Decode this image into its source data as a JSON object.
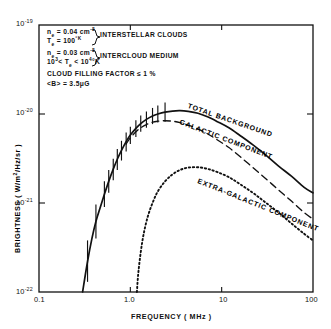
{
  "chart_data": {
    "type": "line",
    "title": "",
    "xlabel": "FREQUENCY ( MHz )",
    "ylabel": "BRIGHTNESS ( W/m2/Hz/sr )",
    "xscale": "log",
    "yscale": "log",
    "xlim": [
      0.1,
      100
    ],
    "ylim": [
      1e-22,
      1e-19
    ],
    "xticks": [
      "0.1",
      "1.0",
      "10",
      "100"
    ],
    "xtick_values": [
      0.1,
      1.0,
      10,
      100
    ],
    "yticks": [
      "10-19",
      "10-20",
      "10-21",
      "10-22"
    ],
    "ytick_values": [
      1e-19,
      1e-20,
      1e-21,
      1e-22
    ],
    "grid": false,
    "legend": "inline-curve-labels",
    "series": [
      {
        "name": "TOTAL BACKGROUND",
        "style": "solid",
        "points": [
          [
            0.3,
            1e-22
          ],
          [
            0.34,
            2.2e-22
          ],
          [
            0.38,
            4e-22
          ],
          [
            0.42,
            6.2e-22
          ],
          [
            0.47,
            9e-22
          ],
          [
            0.52,
            1.25e-21
          ],
          [
            0.58,
            1.75e-21
          ],
          [
            0.65,
            2.4e-21
          ],
          [
            0.72,
            3.1e-21
          ],
          [
            0.8,
            3.9e-21
          ],
          [
            0.9,
            4.9e-21
          ],
          [
            1.0,
            5.8e-21
          ],
          [
            1.15,
            6.9e-21
          ],
          [
            1.3,
            7.8e-21
          ],
          [
            1.5,
            8.7e-21
          ],
          [
            1.75,
            9.5e-21
          ],
          [
            2.0,
            1e-20
          ],
          [
            2.4,
            1.05e-20
          ],
          [
            2.9,
            1.08e-20
          ],
          [
            3.5,
            1.09e-20
          ],
          [
            4.3,
            1.07e-20
          ],
          [
            5.5,
            1.02e-20
          ],
          [
            7.0,
            9.3e-21
          ],
          [
            9.0,
            8.2e-21
          ],
          [
            12.0,
            7e-21
          ],
          [
            16.0,
            5.7e-21
          ],
          [
            22.0,
            4.5e-21
          ],
          [
            30.0,
            3.5e-21
          ],
          [
            42.0,
            2.6e-21
          ],
          [
            58.0,
            2e-21
          ],
          [
            80.0,
            1.5e-21
          ],
          [
            100.0,
            1.3e-21
          ]
        ]
      },
      {
        "name": "GALACTIC COMPONENT",
        "style": "dashed",
        "points": [
          [
            0.9,
            4.6e-21
          ],
          [
            1.0,
            5.4e-21
          ],
          [
            1.15,
            6.3e-21
          ],
          [
            1.3,
            7e-21
          ],
          [
            1.5,
            7.6e-21
          ],
          [
            1.75,
            8.1e-21
          ],
          [
            2.0,
            8.3e-21
          ],
          [
            2.4,
            8.4e-21
          ],
          [
            2.9,
            8.3e-21
          ],
          [
            3.5,
            8e-21
          ],
          [
            4.3,
            7.5e-21
          ],
          [
            5.5,
            6.8e-21
          ],
          [
            7.0,
            6e-21
          ],
          [
            9.0,
            5.1e-21
          ],
          [
            12.0,
            4.2e-21
          ],
          [
            16.0,
            3.3e-21
          ],
          [
            22.0,
            2.5e-21
          ],
          [
            30.0,
            1.9e-21
          ],
          [
            42.0,
            1.4e-21
          ],
          [
            58.0,
            1.05e-21
          ],
          [
            80.0,
            7.8e-22
          ],
          [
            100.0,
            6.6e-22
          ]
        ]
      },
      {
        "name": "EXTRA-GALACTIC COMPONENT",
        "style": "dotted",
        "points": [
          [
            1.18,
            1e-22
          ],
          [
            1.22,
            1.6e-22
          ],
          [
            1.3,
            2.8e-22
          ],
          [
            1.4,
            4.5e-22
          ],
          [
            1.55,
            7e-22
          ],
          [
            1.75,
            1e-21
          ],
          [
            2.0,
            1.35e-21
          ],
          [
            2.4,
            1.75e-21
          ],
          [
            2.9,
            2.1e-21
          ],
          [
            3.5,
            2.35e-21
          ],
          [
            4.3,
            2.5e-21
          ],
          [
            5.5,
            2.52e-21
          ],
          [
            7.0,
            2.42e-21
          ],
          [
            9.0,
            2.22e-21
          ],
          [
            12.0,
            1.95e-21
          ],
          [
            16.0,
            1.62e-21
          ],
          [
            22.0,
            1.3e-21
          ],
          [
            30.0,
            1.02e-21
          ],
          [
            42.0,
            7.8e-22
          ],
          [
            58.0,
            5.9e-22
          ],
          [
            80.0,
            4.5e-22
          ],
          [
            100.0,
            3.8e-22
          ]
        ]
      }
    ],
    "error_bars": [
      {
        "x": 0.34,
        "y": 2.2e-22,
        "lo": 1.3e-22,
        "hi": 3.8e-22
      },
      {
        "x": 0.42,
        "y": 6.2e-22,
        "lo": 4e-22,
        "hi": 9.6e-22
      },
      {
        "x": 0.52,
        "y": 1.25e-21,
        "lo": 9e-22,
        "hi": 1.75e-21
      },
      {
        "x": 0.58,
        "y": 1.75e-21,
        "lo": 1.3e-21,
        "hi": 2.35e-21
      },
      {
        "x": 0.65,
        "y": 2.4e-21,
        "lo": 1.8e-21,
        "hi": 3.15e-21
      },
      {
        "x": 0.72,
        "y": 3.1e-21,
        "lo": 2.35e-21,
        "hi": 4.05e-21
      },
      {
        "x": 0.8,
        "y": 3.9e-21,
        "lo": 3e-21,
        "hi": 5e-21
      },
      {
        "x": 0.9,
        "y": 4.9e-21,
        "lo": 3.8e-21,
        "hi": 6.2e-21
      },
      {
        "x": 1.0,
        "y": 5.8e-21,
        "lo": 4.6e-21,
        "hi": 7.2e-21
      },
      {
        "x": 1.15,
        "y": 6.9e-21,
        "lo": 5.5e-21,
        "hi": 8.5e-21
      },
      {
        "x": 1.3,
        "y": 7.8e-21,
        "lo": 6.3e-21,
        "hi": 9.6e-21
      },
      {
        "x": 1.5,
        "y": 8.7e-21,
        "lo": 7e-21,
        "hi": 1.07e-20
      },
      {
        "x": 1.75,
        "y": 9.5e-21,
        "lo": 7.7e-21,
        "hi": 1.17e-20
      },
      {
        "x": 2.0,
        "y": 1e-20,
        "lo": 8e-21,
        "hi": 1.25e-20
      },
      {
        "x": 2.4,
        "y": 1.05e-20,
        "lo": 8.2e-21,
        "hi": 1.35e-20
      }
    ]
  },
  "annotation": {
    "line1_ne": "n",
    "line1_ne_sub": "e",
    "line1_eq": " = 0.04 cm",
    "line1_sup": "-3",
    "line2_te": "T",
    "line2_te_sub": "e",
    "line2_eq": " = 100",
    "line2_sup": "°K",
    "brace1_label": "INTERSTELLAR CLOUDS",
    "line3_ne": "n",
    "line3_ne_sub": "e",
    "line3_eq": " = 0.03 cm",
    "line3_sup": "-3",
    "line4_pre": "10",
    "line4_pre_sup": "3",
    "line4_mid": "< T",
    "line4_mid_sub": "e",
    "line4_post": " < 10",
    "line4_post_sup": "4",
    "line4_end": "°K",
    "brace2_label": "INTERCLOUD MEDIUM",
    "line5": "CLOUD FILLING FACTOR ≤ 1 %",
    "line6_pre": "<B> = 3.5",
    "line6_mu": "μ",
    "line6_post": "G"
  },
  "curve_labels": {
    "total": "TOTAL BACKGROUND",
    "galactic": "GALACTIC COMPONENT",
    "extragalactic": "EXTRA-GALACTIC COMPONENT"
  },
  "axis_labels": {
    "x": "FREQUENCY ( MHz )",
    "y_pre": "BRIGHTNESS ( W/m",
    "y_sup": "2",
    "y_post": "/Hz/sr )"
  },
  "ytick_labels": [
    {
      "mant": "10",
      "exp": "-19"
    },
    {
      "mant": "10",
      "exp": "-20"
    },
    {
      "mant": "10",
      "exp": "-21"
    },
    {
      "mant": "10",
      "exp": "-22"
    }
  ],
  "xtick_labels": [
    "0.1",
    "1.0",
    "10",
    "100"
  ],
  "colors": {
    "ink": "#111111",
    "background": "#ffffff"
  }
}
